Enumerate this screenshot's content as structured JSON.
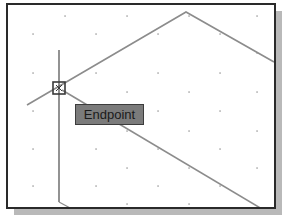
{
  "viewport": {
    "frame_color": "#2a2a2a",
    "background": "#ffffff",
    "shadow_color": "#b9b9b9"
  },
  "grid": {
    "dot_color": "#8a8a8a",
    "dots": [
      [
        57,
        11
      ],
      [
        119,
        11
      ],
      [
        181,
        11
      ],
      [
        249,
        11
      ],
      [
        25,
        29
      ],
      [
        88,
        29
      ],
      [
        150,
        29
      ],
      [
        212,
        29
      ],
      [
        25,
        68
      ],
      [
        88,
        68
      ],
      [
        150,
        68
      ],
      [
        212,
        68
      ],
      [
        249,
        48
      ],
      [
        119,
        87
      ],
      [
        181,
        87
      ],
      [
        249,
        87
      ],
      [
        25,
        106
      ],
      [
        88,
        106
      ],
      [
        150,
        106
      ],
      [
        212,
        106
      ],
      [
        119,
        126
      ],
      [
        181,
        126
      ],
      [
        249,
        126
      ],
      [
        25,
        144
      ],
      [
        88,
        144
      ],
      [
        150,
        144
      ],
      [
        212,
        144
      ],
      [
        25,
        181
      ],
      [
        88,
        181
      ],
      [
        150,
        181
      ],
      [
        212,
        181
      ],
      [
        119,
        163
      ],
      [
        181,
        163
      ],
      [
        249,
        163
      ],
      [
        119,
        199
      ],
      [
        181,
        199
      ]
    ]
  },
  "geometry": {
    "line_color": "#8c8c8c",
    "crosshair_color": "#4a4a4a",
    "polyline_top": [
      [
        19,
        100
      ],
      [
        178,
        7
      ],
      [
        266,
        57
      ]
    ],
    "line_lower": [
      [
        54,
        85
      ],
      [
        254,
        204
      ]
    ],
    "crosshair_vertical": [
      [
        51,
        45
      ],
      [
        51,
        197
      ]
    ],
    "crosshair_foot": [
      [
        51,
        197
      ],
      [
        64,
        204
      ]
    ]
  },
  "snap_marker": {
    "type": "endpoint-square",
    "center": [
      51,
      83
    ],
    "size": 12,
    "color": "#3a3a3a"
  },
  "tooltip": {
    "label": "Endpoint",
    "background": "#7b7b7b",
    "text_color": "#1a1a1a"
  }
}
